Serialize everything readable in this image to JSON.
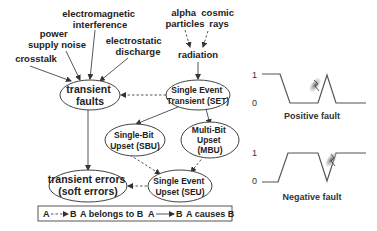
{
  "diagram": {
    "sources": [
      {
        "id": "crosstalk",
        "lines": [
          "crosstalk"
        ]
      },
      {
        "id": "power-supply-noise",
        "lines": [
          "power",
          "supply noise"
        ]
      },
      {
        "id": "electromagnetic-interference",
        "lines": [
          "electromagnetic",
          "interference"
        ]
      },
      {
        "id": "electrostatic-discharge",
        "lines": [
          "electrostatic",
          "discharge"
        ]
      },
      {
        "id": "alpha-particles",
        "lines": [
          "alpha",
          "particles"
        ]
      },
      {
        "id": "cosmic-rays",
        "lines": [
          "cosmic",
          "rays"
        ]
      },
      {
        "id": "radiation",
        "lines": [
          "radiation"
        ]
      }
    ],
    "nodes": [
      {
        "id": "transient-faults",
        "lines": [
          "transient",
          "faults"
        ]
      },
      {
        "id": "set",
        "lines": [
          "Single Event",
          "Transient (SET)"
        ]
      },
      {
        "id": "sbu",
        "lines": [
          "Single-Bit",
          "Upset (SBU)"
        ]
      },
      {
        "id": "mbu",
        "lines": [
          "Multi-Bit",
          "Upset",
          "(MBU)"
        ]
      },
      {
        "id": "transient-errors",
        "lines": [
          "transient errors",
          "(soft errors)"
        ]
      },
      {
        "id": "seu",
        "lines": [
          "Single Event",
          "Upset (SEU)"
        ]
      }
    ],
    "edges": [
      {
        "from": "crosstalk",
        "to": "transient-faults",
        "type": "causes"
      },
      {
        "from": "power-supply-noise",
        "to": "transient-faults",
        "type": "causes"
      },
      {
        "from": "electromagnetic-interference",
        "to": "transient-faults",
        "type": "causes"
      },
      {
        "from": "electrostatic-discharge",
        "to": "transient-faults",
        "type": "causes"
      },
      {
        "from": "alpha-particles",
        "to": "radiation",
        "type": "belongs_to"
      },
      {
        "from": "cosmic-rays",
        "to": "radiation",
        "type": "belongs_to"
      },
      {
        "from": "radiation",
        "to": "set",
        "type": "causes"
      },
      {
        "from": "set",
        "to": "transient-faults",
        "type": "belongs_to"
      },
      {
        "from": "set",
        "to": "sbu",
        "type": "causes"
      },
      {
        "from": "set",
        "to": "mbu",
        "type": "causes"
      },
      {
        "from": "sbu",
        "to": "seu",
        "type": "belongs_to"
      },
      {
        "from": "mbu",
        "to": "seu",
        "type": "belongs_to"
      },
      {
        "from": "seu",
        "to": "transient-errors",
        "type": "belongs_to"
      },
      {
        "from": "transient-faults",
        "to": "transient-errors",
        "type": "causes"
      }
    ],
    "legend": {
      "belongs_to": {
        "a": "A",
        "b": "B",
        "text": "A belongs to B"
      },
      "causes": {
        "a": "A",
        "b": "B",
        "text": "A causes B"
      }
    }
  },
  "waveforms": [
    {
      "id": "positive-fault",
      "caption": "Positive fault",
      "y_high": "1",
      "y_low": "0"
    },
    {
      "id": "negative-fault",
      "caption": "Negative fault",
      "y_high": "1",
      "y_low": "0"
    }
  ]
}
